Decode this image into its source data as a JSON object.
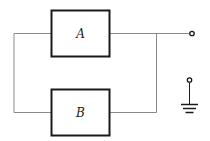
{
  "diagram": {
    "type": "circuit",
    "blocks": [
      {
        "id": "A",
        "label": "A"
      },
      {
        "id": "B",
        "label": "B"
      }
    ],
    "connections": "A and B in parallel",
    "terminals": [
      {
        "name": "output-terminal"
      },
      {
        "name": "ground-terminal"
      }
    ]
  },
  "colors": {
    "line": "#8a8a8a",
    "box_border": "#1a1a1a",
    "background": "#ffffff"
  }
}
